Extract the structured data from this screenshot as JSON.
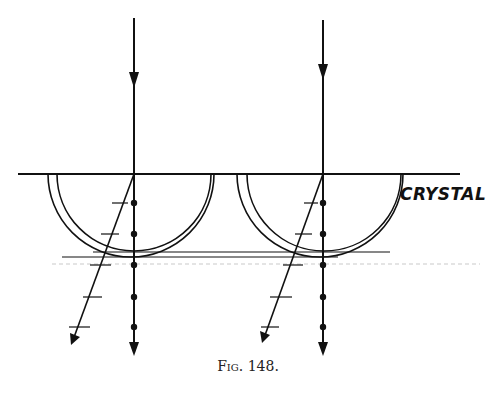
{
  "figure": {
    "caption": "Fig. 148.",
    "label": "CRYSTAL",
    "surface": {
      "y": 174,
      "x1": 18,
      "x2": 460
    },
    "rays": [
      {
        "name": "left",
        "x": 134,
        "dots_y": [
          203,
          234,
          265,
          297,
          327
        ],
        "oblique_end": [
          72,
          342
        ]
      },
      {
        "name": "right",
        "x": 323,
        "dots_y": [
          203,
          234,
          265,
          297,
          327
        ],
        "oblique_end": [
          262,
          340
        ]
      }
    ],
    "colors": {
      "ink": "#111111",
      "background": "#ffffff"
    }
  }
}
